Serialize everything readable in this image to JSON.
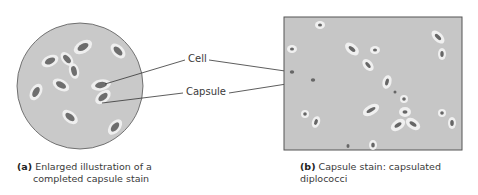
{
  "figure": {
    "panel_a": {
      "tag": "(a)",
      "caption_line1": "Enlarged illustration of a",
      "caption_line2": "completed capsule stain"
    },
    "panel_b": {
      "tag": "(b)",
      "caption": "Capsule stain: capsulated diplococci"
    },
    "labels": {
      "cell": "Cell",
      "capsule": "Capsule"
    },
    "colors": {
      "field_background": "#c8c8c8",
      "capsule_halo": "#efefef",
      "cell_body": "#6e6e6e",
      "photo_background": "#c6c6c6",
      "leader_line": "#333333"
    }
  }
}
